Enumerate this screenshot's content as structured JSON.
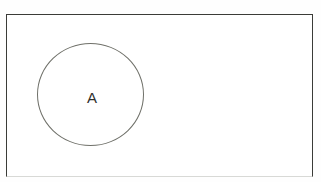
{
  "diagram": {
    "type": "venn-diagram",
    "title": "",
    "universe": {
      "name": "universal-set-rectangle",
      "label": "",
      "border_color": "#3b3c38",
      "fill_color": "#ffffff"
    },
    "sets": [
      {
        "id": "A",
        "label": "A",
        "shape": "circle",
        "stroke_color": "#6f7069",
        "fill_color": "transparent",
        "label_color": "#2f302c"
      }
    ],
    "background_color": "#fefefe"
  }
}
